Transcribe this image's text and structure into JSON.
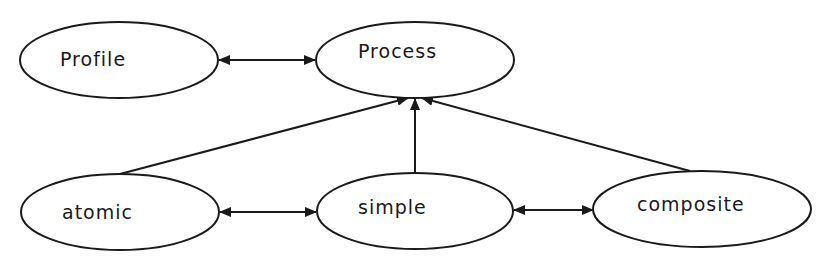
{
  "diagram": {
    "type": "concept-relationship",
    "nodes": [
      {
        "id": "profile",
        "label": "Profile",
        "cx": 119,
        "cy": 60,
        "rx": 99,
        "ry": 38,
        "tx": 60,
        "ty": 60
      },
      {
        "id": "process",
        "label": "Process",
        "cx": 415,
        "cy": 60,
        "rx": 99,
        "ry": 38,
        "tx": 358,
        "ty": 52
      },
      {
        "id": "atomic",
        "label": "atomic",
        "cx": 120,
        "cy": 212,
        "rx": 99,
        "ry": 38,
        "tx": 62,
        "ty": 215
      },
      {
        "id": "simple",
        "label": "simple",
        "cx": 415,
        "cy": 211,
        "rx": 98,
        "ry": 38,
        "tx": 358,
        "ty": 214
      },
      {
        "id": "composite",
        "label": "composite",
        "cx": 702,
        "cy": 209,
        "rx": 109,
        "ry": 38,
        "tx": 637,
        "ty": 211
      }
    ],
    "edges": [
      {
        "from": "profile",
        "to": "process",
        "kind": "bidirectional"
      },
      {
        "from": "atomic",
        "to": "process",
        "kind": "directed"
      },
      {
        "from": "simple",
        "to": "process",
        "kind": "directed"
      },
      {
        "from": "composite",
        "to": "process",
        "kind": "directed"
      },
      {
        "from": "atomic",
        "to": "simple",
        "kind": "bidirectional"
      },
      {
        "from": "simple",
        "to": "composite",
        "kind": "bidirectional"
      }
    ],
    "colors": {
      "stroke": "#1a1a1a",
      "background": "#ffffff"
    }
  }
}
